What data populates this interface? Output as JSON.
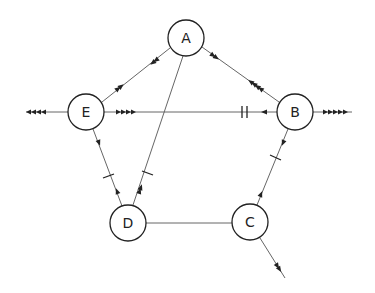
{
  "diagram": {
    "type": "directed-graph",
    "nodes": [
      {
        "id": "A",
        "label": "A",
        "x": 186,
        "y": 38
      },
      {
        "id": "B",
        "label": "B",
        "x": 295,
        "y": 112
      },
      {
        "id": "C",
        "label": "C",
        "x": 250,
        "y": 222
      },
      {
        "id": "D",
        "label": "D",
        "x": 128,
        "y": 223
      },
      {
        "id": "E",
        "label": "E",
        "x": 86,
        "y": 112
      }
    ],
    "edges": [
      {
        "from": "A",
        "to": "B",
        "markers": "2 arrows toward B near A, 4 arrows toward A near B"
      },
      {
        "from": "A",
        "to": "E",
        "markers": "2 arrows toward E near A, 2 arrows toward A near E"
      },
      {
        "from": "A",
        "to": "D",
        "markers": "tick mark, 2 arrows toward A near D"
      },
      {
        "from": "E",
        "to": "B",
        "markers": "4 arrows toward B near E, double tick and 1 arrow toward E near B"
      },
      {
        "from": "E",
        "to": "D",
        "markers": "1 arrow toward D near E, tick and 1 arrow toward E near D"
      },
      {
        "from": "B",
        "to": "C",
        "markers": "1 arrow toward C near B, tick mark"
      },
      {
        "from": "C",
        "to": "B",
        "markers": "1 arrow toward B near C"
      },
      {
        "from": "D",
        "to": "C",
        "markers": "none"
      },
      {
        "from": "E",
        "to": "outside-left",
        "markers": "4 arrows pointing left"
      },
      {
        "from": "B",
        "to": "outside-right",
        "markers": "5 arrows pointing right"
      },
      {
        "from": "C",
        "to": "outside-bottom-right",
        "markers": "2 arrows pointing down-right"
      }
    ],
    "colors": {
      "line": "#555555",
      "node_stroke": "#222222",
      "background": "#ffffff"
    }
  }
}
